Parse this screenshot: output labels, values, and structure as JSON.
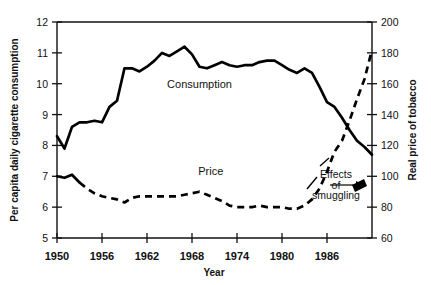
{
  "chart_data": {
    "type": "line",
    "title": "",
    "xlabel": "Year",
    "ylabel": "Per capita daily cigarette consumption",
    "y2label": "Real price of tobacco",
    "xlim": [
      1950,
      1992
    ],
    "ylim": [
      5,
      12
    ],
    "y2lim": [
      60,
      200
    ],
    "grid": false,
    "legend": "inline-labels",
    "xticks": [
      1950,
      1956,
      1962,
      1968,
      1974,
      1980,
      1986
    ],
    "xtick_labels": [
      "1950",
      "1956",
      "1962",
      "1968",
      "1974",
      "1980",
      "1986"
    ],
    "yticks": [
      5,
      6,
      7,
      8,
      9,
      10,
      11,
      12
    ],
    "ytick_labels": [
      "5",
      "6",
      "7",
      "8",
      "9",
      "10",
      "11",
      "12"
    ],
    "y2ticks": [
      60,
      80,
      100,
      120,
      140,
      160,
      180,
      200
    ],
    "y2tick_labels": [
      "60",
      "80",
      "100",
      "120",
      "140",
      "160",
      "180",
      "200"
    ],
    "annotations": [
      {
        "name": "consumption-series-label",
        "text": "Consumption",
        "x": 1969,
        "y": 9.85
      },
      {
        "name": "price-series-label",
        "text": "Price",
        "x": 1970.5,
        "y": 7.05
      },
      {
        "name": "smuggling-note-line1",
        "text": "Effects",
        "x": 1987.2,
        "y": 6.95
      },
      {
        "name": "smuggling-note-line2",
        "text": "of",
        "x": 1987.2,
        "y": 6.6
      },
      {
        "name": "smuggling-note-line3",
        "text": "smuggling",
        "x": 1987.2,
        "y": 6.25
      }
    ],
    "series": [
      {
        "name": "Consumption",
        "axis": "left",
        "style": "solid",
        "x": [
          1950,
          1951,
          1952,
          1953,
          1954,
          1955,
          1956,
          1957,
          1958,
          1959,
          1960,
          1961,
          1962,
          1963,
          1964,
          1965,
          1966,
          1967,
          1968,
          1969,
          1970,
          1971,
          1972,
          1973,
          1974,
          1975,
          1976,
          1977,
          1978,
          1979,
          1980,
          1981,
          1982,
          1983,
          1984,
          1985,
          1986,
          1987,
          1988,
          1989,
          1990,
          1991,
          1992
        ],
        "values": [
          8.3,
          7.9,
          8.6,
          8.75,
          8.75,
          8.8,
          8.75,
          9.25,
          9.45,
          10.5,
          10.5,
          10.4,
          10.55,
          10.75,
          11.0,
          10.9,
          11.05,
          11.2,
          10.95,
          10.55,
          10.5,
          10.6,
          10.7,
          10.6,
          10.55,
          10.6,
          10.6,
          10.7,
          10.75,
          10.75,
          10.6,
          10.45,
          10.35,
          10.5,
          10.35,
          9.9,
          9.4,
          9.25,
          8.9,
          8.5,
          8.15,
          7.95,
          7.7
        ]
      },
      {
        "name": "Price",
        "axis": "right",
        "style": "dashed",
        "x": [
          1950,
          1951,
          1952,
          1953,
          1954,
          1955,
          1956,
          1957,
          1958,
          1959,
          1960,
          1961,
          1962,
          1963,
          1964,
          1965,
          1966,
          1967,
          1968,
          1969,
          1970,
          1971,
          1972,
          1973,
          1974,
          1975,
          1976,
          1977,
          1978,
          1979,
          1980,
          1981,
          1982,
          1983,
          1984,
          1985,
          1986,
          1987,
          1988,
          1989,
          1990,
          1991,
          1992
        ],
        "values": [
          100,
          99,
          101,
          96,
          92,
          89,
          87,
          86,
          85,
          83,
          86,
          87,
          87,
          87,
          87,
          87,
          87,
          88,
          89,
          90,
          88,
          86,
          84,
          81,
          80,
          80,
          80,
          81,
          80,
          80,
          80,
          79,
          79,
          81,
          85,
          92,
          103,
          116,
          123,
          136,
          150,
          163,
          182
        ]
      }
    ]
  }
}
